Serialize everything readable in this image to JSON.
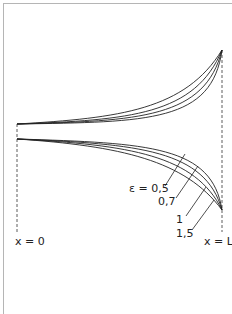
{
  "diagram": {
    "type": "curve-family",
    "boundary_labels": {
      "left": "x = 0",
      "right": "x = L"
    },
    "curve_labels": [
      "ε = 0,5",
      "0,7",
      "1",
      "1,5"
    ],
    "parameter": "ε",
    "parameter_values": [
      0.5,
      0.7,
      1,
      1.5
    ],
    "colors": {
      "line": "#222222",
      "frame": "#b5b5b5"
    }
  }
}
